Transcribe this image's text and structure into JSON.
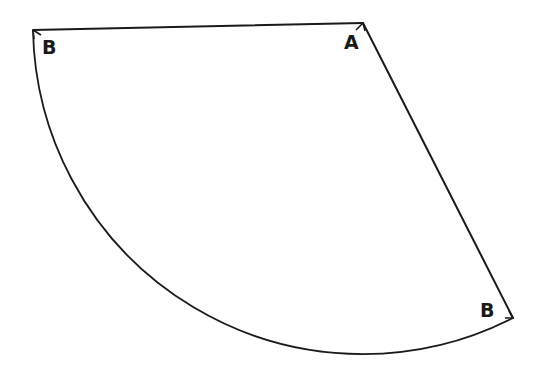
{
  "diagram": {
    "type": "cone-net-sector",
    "stroke_color": "#1a1a1a",
    "background": "#ffffff",
    "labels": {
      "apex": "A",
      "corner_left": "B",
      "corner_right": "B"
    }
  }
}
